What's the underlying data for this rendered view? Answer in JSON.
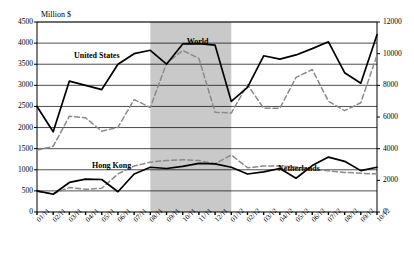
{
  "chart_data": {
    "type": "line",
    "title": "",
    "unit_label": "Million $",
    "xlabel": "",
    "ylabel": "Million $",
    "grid": true,
    "legend_position": "inline-annotations",
    "x": [
      "01/11",
      "02/11",
      "03/11",
      "04/11",
      "05/11",
      "06/11",
      "07/11",
      "08/11",
      "09/11",
      "10/11",
      "11/11",
      "12/11",
      "01/12",
      "02/12",
      "03/12",
      "04/12",
      "05/12",
      "06/12",
      "07/12",
      "08/12",
      "09/12",
      "10/12"
    ],
    "left_axis": {
      "label": "Million $",
      "min": 0,
      "max": 4500,
      "step": 500,
      "ticks": [
        0,
        500,
        1000,
        1500,
        2000,
        2500,
        3000,
        3500,
        4000,
        4500
      ]
    },
    "right_axis": {
      "label": "",
      "min": 0,
      "max": 12000,
      "step": 2000,
      "ticks": [
        0,
        2000,
        4000,
        6000,
        8000,
        10000,
        12000
      ]
    },
    "shaded_band": {
      "from": "08/11",
      "to": "01/12",
      "color": "#c9c9c9",
      "label": ""
    },
    "series": [
      {
        "name": "World",
        "axis": "right",
        "style": "dashed",
        "color": "#8a8a8a",
        "label_x": "10/11",
        "values": [
          3900,
          4150,
          6050,
          5950,
          5100,
          5350,
          7100,
          6600,
          9400,
          10200,
          9700,
          6300,
          6250,
          8050,
          6550,
          6550,
          8500,
          9000,
          7000,
          6400,
          6900,
          9900
        ]
      },
      {
        "name": "United States",
        "axis": "left",
        "style": "solid",
        "color": "#000000",
        "label_x": "06/11",
        "values": [
          2500,
          1900,
          3100,
          3000,
          2900,
          3500,
          3750,
          3830,
          3500,
          3980,
          3990,
          3950,
          2620,
          2950,
          3700,
          3620,
          3720,
          3870,
          4030,
          3300,
          3050,
          4200
        ]
      },
      {
        "name": "Hong Kong",
        "axis": "right",
        "style": "dashed",
        "color": "#8a8a8a",
        "label_x": "06/11",
        "values": [
          1300,
          1150,
          1550,
          1430,
          1500,
          2400,
          2900,
          3150,
          3250,
          3300,
          3250,
          3050,
          3600,
          2800,
          2900,
          2900,
          2850,
          2700,
          2600,
          2500,
          2450,
          2400
        ]
      },
      {
        "name": "Netherlands",
        "axis": "left",
        "style": "solid",
        "color": "#000000",
        "label_x": "05/12",
        "values": [
          500,
          420,
          700,
          780,
          770,
          480,
          900,
          1060,
          1030,
          1080,
          1150,
          1140,
          1060,
          900,
          950,
          1030,
          800,
          1100,
          1300,
          1200,
          980,
          1060
        ]
      }
    ]
  },
  "annotations": {
    "world": "World",
    "united_states": "United States",
    "hong_kong": "Hong Kong",
    "netherlands": "Netherlands"
  }
}
